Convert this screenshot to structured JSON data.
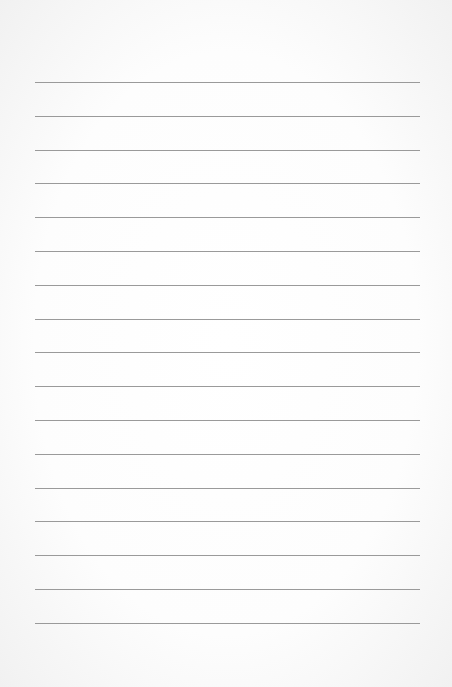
{
  "page": {
    "type": "lined-paper",
    "background_color": "#ffffff",
    "line_color": "#9a9a9a",
    "line_count": 17,
    "first_line_y": 82,
    "line_spacing": 33.8,
    "line_left": 35,
    "line_right": 420
  }
}
